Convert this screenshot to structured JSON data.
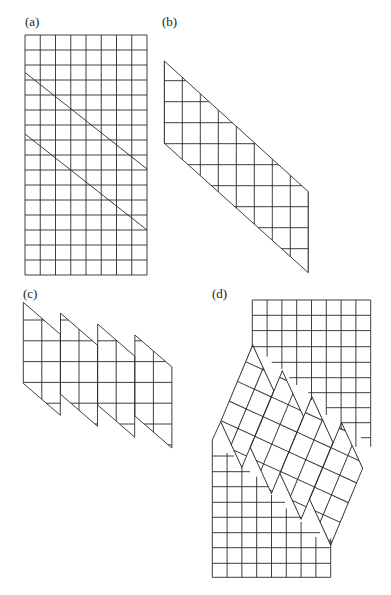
{
  "figure": {
    "stroke_color": "#2a2a2a",
    "background": "#ffffff",
    "panels": [
      {
        "id": "a",
        "label": "(a)",
        "label_pos": [
          25,
          15
        ],
        "description": "8 x 16 square grid cut by two parallel diagonal lines",
        "grid": {
          "x": 25,
          "y": 35,
          "cols": 8,
          "rows": 16,
          "width": 122,
          "height": 240
        },
        "cuts": [
          {
            "from": [
              25,
              72.5
            ],
            "to": [
              147,
              169
            ]
          },
          {
            "from": [
              25,
              134
            ],
            "to": [
              147,
              230
            ]
          }
        ]
      },
      {
        "id": "b",
        "label": "(b)",
        "label_pos": [
          162,
          15
        ],
        "description": "Parallelogram cut out of the grid",
        "outline": [
          [
            164.3,
            61
          ],
          [
            308.3,
            191.7
          ],
          [
            308.3,
            272.7
          ],
          [
            164.3,
            143.3
          ]
        ],
        "verticals": {
          "x0": 164.3,
          "step": 18,
          "count": 9
        },
        "horizontals": {
          "y0": 80.7,
          "step": 21,
          "count": 9
        }
      },
      {
        "id": "c",
        "label": "(c)",
        "label_pos": [
          23,
          287
        ],
        "description": "Parallelogram sliced into four 2-column strips forming a sawtooth",
        "strips": {
          "origin": [
            23.3,
            302.3
          ],
          "step": [
            37.2,
            10.9
          ],
          "count": 4,
          "width": 37,
          "height": 81,
          "top_drop": 32,
          "col_width": 18.5
        },
        "horizontals": {
          "y0": 320,
          "step": 20.8,
          "count": 7
        }
      },
      {
        "id": "d",
        "label": "(d)",
        "label_pos": [
          212,
          287
        ],
        "description": "Staircase grids with the rotated sawtooth strips fitted between them",
        "top_grid": {
          "x": 252.3,
          "y": 300,
          "right": 370.7,
          "col_step": 14.8,
          "row_step": 15.3,
          "full_rows": 3,
          "stair_rows": [
            {
              "y": 346.7,
              "x_start": 252.3
            },
            {
              "y": 362.3,
              "x_start": 271.7
            },
            {
              "y": 377.7,
              "x_start": 289.3
            },
            {
              "y": 392.7,
              "x_start": 308.3
            },
            {
              "y": 407.7,
              "x_start": 326.7
            },
            {
              "y": 422.7,
              "x_start": 341.7
            },
            {
              "y": 437.7,
              "x_start": 361
            }
          ],
          "vertical_bottoms": [
            346.7,
            356.7,
            369,
            385,
            400,
            415,
            430,
            446.7
          ]
        },
        "bottom_grid": {
          "x": 212.3,
          "right": 330.7,
          "bottom": 577.3,
          "col_step": 14.8,
          "left_top": 440,
          "stair_rows": [
            {
              "y": 456,
              "x_end": 234
            },
            {
              "y": 471.7,
              "x_end": 250
            },
            {
              "y": 486.7,
              "x_end": 268.3
            },
            {
              "y": 502.3,
              "x_end": 285
            },
            {
              "y": 517.3,
              "x_end": 301.7
            },
            {
              "y": 532.7,
              "x_end": 320
            },
            {
              "y": 547.7,
              "x_end": 330.7
            },
            {
              "y": 563.3,
              "x_end": 330.7
            },
            {
              "y": 577.3,
              "x_end": 330.7
            }
          ],
          "vertical_tops": [
            440,
            453,
            466,
            476.7,
            495,
            508.3,
            522,
            537,
            538.3
          ]
        },
        "rotated_sawtooth_transform": "matrix(0.912 0.418 -0.395 0.947 350.85 48.96)",
        "left_joint": [
          [
            220.7,
            421.7
          ],
          [
            212.3,
            440
          ]
        ]
      }
    ]
  }
}
